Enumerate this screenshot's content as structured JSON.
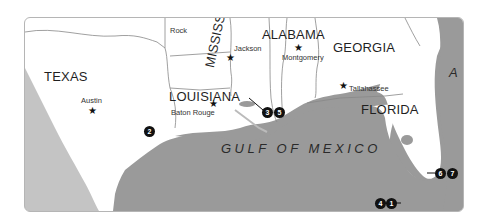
{
  "map": {
    "colors": {
      "land": "#ffffff",
      "water": "#9a9a9a",
      "border": "#888888",
      "marker": "#111111"
    },
    "states": [
      {
        "id": "texas",
        "label": "TEXAS"
      },
      {
        "id": "louisiana",
        "label": "LOUISIANA"
      },
      {
        "id": "mississippi",
        "label": "MISSISSIPPI"
      },
      {
        "id": "alabama",
        "label": "ALABAMA"
      },
      {
        "id": "georgia",
        "label": "GEORGIA"
      },
      {
        "id": "florida",
        "label": "FLORIDA"
      }
    ],
    "cities": [
      {
        "id": "little-rock",
        "label": "Little Rock",
        "visible_text": "Rock"
      },
      {
        "id": "austin",
        "label": "Austin"
      },
      {
        "id": "baton-rouge",
        "label": "Baton Rouge"
      },
      {
        "id": "jackson",
        "label": "Jackson"
      },
      {
        "id": "montgomery",
        "label": "Montgomery"
      },
      {
        "id": "tallahassee",
        "label": "Tallahassee"
      }
    ],
    "water_bodies": [
      {
        "id": "gulf",
        "label": "GULF OF MEXICO"
      },
      {
        "id": "atlantic",
        "label": "A"
      }
    ],
    "markers": [
      {
        "id": "1",
        "label": "1"
      },
      {
        "id": "2",
        "label": "2"
      },
      {
        "id": "3",
        "label": "3"
      },
      {
        "id": "4",
        "label": "4"
      },
      {
        "id": "5",
        "label": "5"
      },
      {
        "id": "6",
        "label": "6"
      },
      {
        "id": "7",
        "label": "7"
      }
    ],
    "star_glyph": "★"
  }
}
